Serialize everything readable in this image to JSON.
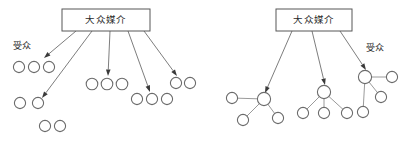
{
  "figure": {
    "background_color": "#ffffff",
    "width": 410,
    "height": 141,
    "stroke_color": "#6b6b6b",
    "text_color": "#2b2b2b"
  },
  "diagrams": [
    {
      "id": "left-diagram",
      "name": "one-step-flow-mass-media-to-audience",
      "source_box": {
        "label": "大众媒介",
        "x": 62,
        "y": 9,
        "width": 88,
        "height": 22
      },
      "side_label": {
        "label": "受众",
        "x": 22,
        "y": 47
      },
      "arrows": [
        {
          "x1": 76,
          "y1": 31,
          "x2": 44,
          "y2": 58
        },
        {
          "x1": 92,
          "y1": 31,
          "x2": 42,
          "y2": 98
        },
        {
          "x1": 110,
          "y1": 31,
          "x2": 108,
          "y2": 76
        },
        {
          "x1": 128,
          "y1": 31,
          "x2": 150,
          "y2": 92
        },
        {
          "x1": 144,
          "y1": 31,
          "x2": 177,
          "y2": 76
        }
      ],
      "node_groups": [
        {
          "name": "group-top-left",
          "cy": 67,
          "cxs": [
            19,
            34,
            49
          ],
          "r": 5.6
        },
        {
          "name": "group-mid-left",
          "cy": 103,
          "cxs": [
            20,
            38
          ],
          "r": 5.6
        },
        {
          "name": "group-bottom-left",
          "cy": 126,
          "cxs": [
            45,
            60
          ],
          "r": 5.6
        },
        {
          "name": "group-center-upper",
          "cy": 84,
          "cxs": [
            92,
            107,
            122
          ],
          "r": 5.8
        },
        {
          "name": "group-center-lower",
          "cy": 99,
          "cxs": [
            137,
            152,
            167
          ],
          "r": 5.6
        },
        {
          "name": "group-right",
          "cy": 83,
          "cxs": [
            176,
            190
          ],
          "r": 5.6
        }
      ]
    },
    {
      "id": "right-diagram",
      "name": "two-step-flow-mass-media-opinion-leaders-audience",
      "source_box": {
        "label": "大众媒介",
        "x": 276,
        "y": 9,
        "width": 76,
        "height": 22
      },
      "side_label": {
        "label": "受众",
        "x": 375,
        "y": 49
      },
      "arrows": [
        {
          "x1": 292,
          "y1": 31,
          "x2": 265,
          "y2": 93
        },
        {
          "x1": 312,
          "y1": 31,
          "x2": 325,
          "y2": 85
        },
        {
          "x1": 340,
          "y1": 31,
          "x2": 366,
          "y2": 70
        }
      ],
      "clusters": [
        {
          "name": "cluster-left",
          "hub": {
            "cx": 264,
            "cy": 99,
            "r": 6.6
          },
          "satellites": [
            {
              "cx": 232,
              "cy": 98,
              "r": 5.6
            },
            {
              "cx": 243,
              "cy": 120,
              "r": 5.6
            },
            {
              "cx": 278,
              "cy": 118,
              "r": 5.6
            }
          ]
        },
        {
          "name": "cluster-middle",
          "hub": {
            "cx": 324,
            "cy": 92,
            "r": 6.6
          },
          "satellites": [
            {
              "cx": 303,
              "cy": 113,
              "r": 5.6
            },
            {
              "cx": 324,
              "cy": 113,
              "r": 5.6
            },
            {
              "cx": 347,
              "cy": 113,
              "r": 5.6
            }
          ]
        },
        {
          "name": "cluster-right",
          "hub": {
            "cx": 365,
            "cy": 77,
            "r": 6.6
          },
          "satellites": [
            {
              "cx": 392,
              "cy": 77,
              "r": 5.6
            },
            {
              "cx": 381,
              "cy": 97,
              "r": 5.6
            },
            {
              "cx": 363,
              "cy": 112,
              "r": 5.6
            }
          ]
        }
      ]
    }
  ]
}
